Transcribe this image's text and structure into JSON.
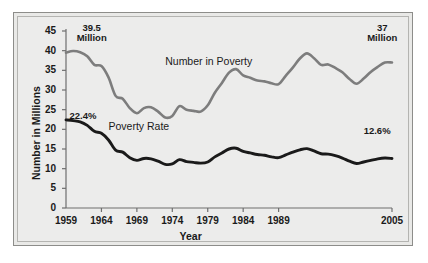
{
  "chart_data": {
    "type": "line",
    "title": "",
    "xlabel": "Year",
    "ylabel": "Number in Millions",
    "xlim": [
      1959,
      2005
    ],
    "ylim": [
      0,
      45
    ],
    "ytick_labels": [
      "45",
      "40",
      "35",
      "30",
      "25",
      "20",
      "15",
      "10",
      "5",
      "0"
    ],
    "ytick_values": [
      45,
      40,
      35,
      30,
      25,
      20,
      15,
      10,
      5,
      0
    ],
    "xtick_labels": [
      "1959",
      "1964",
      "1969",
      "1974",
      "1979",
      "1984",
      "1989",
      "2005"
    ],
    "xtick_values": [
      1959,
      1964,
      1969,
      1974,
      1979,
      1984,
      1989,
      2005
    ],
    "grid": false,
    "legend": "inline-labels",
    "annotations": [
      {
        "name": "start-number-annotation",
        "line1": "39.5",
        "line2": "Million",
        "x": 1960.5,
        "y": 44.5
      },
      {
        "name": "end-number-annotation",
        "line1": "37",
        "line2": "Million",
        "x": 2001.5,
        "y": 44.5
      },
      {
        "name": "start-rate-annotation",
        "text": "22.4%",
        "x": 1959.5,
        "y": 23.5
      },
      {
        "name": "end-rate-annotation",
        "text": "12.6%",
        "x": 2001.0,
        "y": 19.5
      }
    ],
    "series": [
      {
        "name": "Number in Poverty",
        "units": "millions",
        "color": "#7d7d7d",
        "label_x": 1973.0,
        "label_y": 37.0,
        "x": [
          1959,
          1960,
          1961,
          1962,
          1963,
          1964,
          1965,
          1966,
          1967,
          1968,
          1969,
          1970,
          1971,
          1972,
          1973,
          1974,
          1975,
          1976,
          1977,
          1978,
          1979,
          1980,
          1981,
          1982,
          1983,
          1984,
          1985,
          1986,
          1987,
          1988,
          1989,
          1990,
          1991,
          1992,
          1993,
          1994,
          1995,
          1996,
          1997,
          1998,
          1999,
          2000,
          2001,
          2002,
          2003,
          2004,
          2005
        ],
        "values": [
          39.5,
          39.9,
          39.6,
          38.6,
          36.4,
          36.1,
          33.2,
          28.5,
          27.8,
          25.4,
          24.1,
          25.4,
          25.6,
          24.5,
          23.0,
          23.4,
          25.9,
          25.0,
          24.7,
          24.5,
          26.1,
          29.3,
          31.8,
          34.4,
          35.3,
          33.7,
          33.1,
          32.4,
          32.2,
          31.7,
          31.5,
          33.6,
          35.7,
          38.0,
          39.3,
          38.1,
          36.4,
          36.5,
          35.6,
          34.5,
          32.8,
          31.6,
          32.9,
          34.6,
          35.9,
          37.0,
          37.0
        ]
      },
      {
        "name": "Poverty Rate",
        "units": "percent",
        "color": "#1a1a1a",
        "label_x": 1965.0,
        "label_y": 20.5,
        "x": [
          1959,
          1960,
          1961,
          1962,
          1963,
          1964,
          1965,
          1966,
          1967,
          1968,
          1969,
          1970,
          1971,
          1972,
          1973,
          1974,
          1975,
          1976,
          1977,
          1978,
          1979,
          1980,
          1981,
          1982,
          1983,
          1984,
          1985,
          1986,
          1987,
          1988,
          1989,
          1990,
          1991,
          1992,
          1993,
          1994,
          1995,
          1996,
          1997,
          1998,
          1999,
          2000,
          2001,
          2002,
          2003,
          2004,
          2005
        ],
        "values": [
          22.4,
          22.2,
          21.9,
          21.0,
          19.5,
          19.0,
          17.3,
          14.7,
          14.2,
          12.8,
          12.1,
          12.6,
          12.5,
          11.9,
          11.1,
          11.2,
          12.3,
          11.8,
          11.6,
          11.4,
          11.7,
          13.0,
          14.0,
          15.0,
          15.2,
          14.4,
          14.0,
          13.6,
          13.4,
          13.0,
          12.8,
          13.5,
          14.2,
          14.8,
          15.1,
          14.5,
          13.8,
          13.7,
          13.3,
          12.7,
          11.9,
          11.3,
          11.7,
          12.1,
          12.5,
          12.7,
          12.6
        ]
      }
    ]
  },
  "geometry": {
    "plot_left": 66,
    "plot_right": 392,
    "plot_top": 31,
    "plot_bottom": 208
  }
}
